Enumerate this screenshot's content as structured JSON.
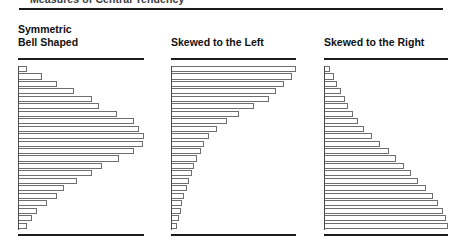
{
  "page": {
    "top_fragment_text": "Measures of Central Tendency",
    "background_color": "#ffffff",
    "rule_color": "#1d1d1d",
    "bar_outline_color": "#6e6e6e",
    "bar_fill_color": "#ffffff"
  },
  "charts": [
    {
      "id": "symmetric-bell-shaped",
      "title": "Symmetric\nBell Shaped",
      "chart_data": {
        "type": "bar",
        "orientation": "horizontal",
        "title": "Symmetric Bell Shaped",
        "xlabel": "",
        "ylabel": "",
        "grid": false,
        "legend": "none",
        "xlim": [
          0,
          100
        ],
        "categories": [
          "1",
          "2",
          "3",
          "4",
          "5",
          "6",
          "7",
          "8",
          "9",
          "10",
          "11",
          "12",
          "13",
          "14",
          "15",
          "16",
          "17",
          "18",
          "19",
          "20",
          "21",
          "22"
        ],
        "values": [
          6,
          18,
          30,
          44,
          58,
          64,
          78,
          92,
          96,
          100,
          99,
          92,
          80,
          66,
          58,
          46,
          36,
          30,
          22,
          14,
          10,
          6
        ]
      }
    },
    {
      "id": "skewed-to-the-left",
      "title": "Skewed to the Left",
      "chart_data": {
        "type": "bar",
        "orientation": "horizontal",
        "title": "Skewed to the Left",
        "xlabel": "",
        "ylabel": "",
        "grid": false,
        "legend": "none",
        "xlim": [
          0,
          100
        ],
        "categories": [
          "1",
          "2",
          "3",
          "4",
          "5",
          "6",
          "7",
          "8",
          "9",
          "10",
          "11",
          "12",
          "13",
          "14",
          "15",
          "16",
          "17",
          "18",
          "19",
          "20",
          "21",
          "22"
        ],
        "values": [
          100,
          97,
          90,
          84,
          78,
          66,
          54,
          44,
          36,
          30,
          26,
          23,
          20,
          18,
          16,
          14,
          12,
          10,
          8,
          7,
          6,
          4
        ]
      }
    },
    {
      "id": "skewed-to-the-right",
      "title": "Skewed to the Right",
      "chart_data": {
        "type": "bar",
        "orientation": "horizontal",
        "title": "Skewed to the Right",
        "xlabel": "",
        "ylabel": "",
        "grid": false,
        "legend": "none",
        "xlim": [
          0,
          100
        ],
        "categories": [
          "1",
          "2",
          "3",
          "4",
          "5",
          "6",
          "7",
          "8",
          "9",
          "10",
          "11",
          "12",
          "13",
          "14",
          "15",
          "16",
          "17",
          "18",
          "19",
          "20",
          "21",
          "22"
        ],
        "values": [
          4,
          7,
          10,
          13,
          16,
          19,
          23,
          27,
          32,
          38,
          45,
          52,
          58,
          64,
          70,
          76,
          82,
          88,
          92,
          96,
          98,
          100
        ]
      }
    }
  ]
}
